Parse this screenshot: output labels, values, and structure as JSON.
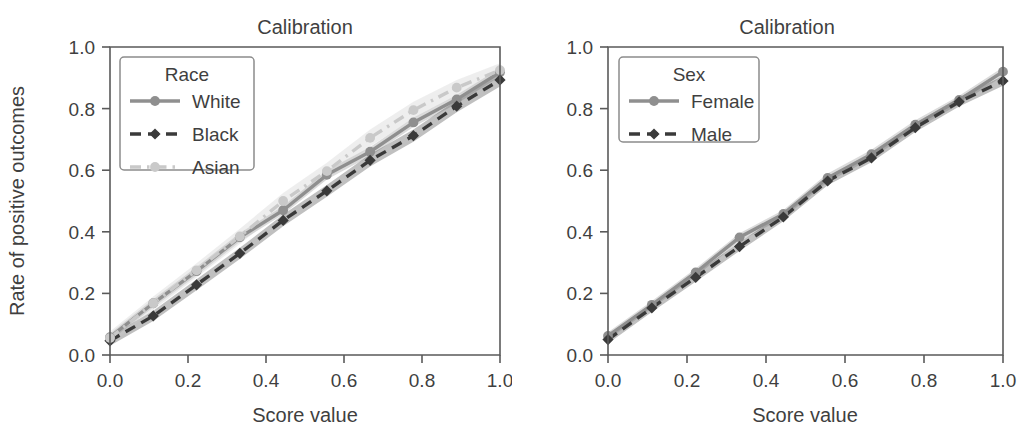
{
  "figure": {
    "width": 1025,
    "height": 434,
    "background": "#ffffff",
    "panels": [
      "race",
      "sex"
    ]
  },
  "colors": {
    "white_series": "#8f8f8f",
    "black_series": "#3a3a3a",
    "asian_series": "#c9c9c9",
    "female_series": "#8f8f8f",
    "male_series": "#3a3a3a",
    "axis": "#5a5a5a",
    "text": "#3f3f3f",
    "band": "#d9d9d9"
  },
  "chart_data": [
    {
      "type": "line",
      "id": "race",
      "title": "Calibration",
      "xlabel": "Score value",
      "ylabel": "Rate of positive outcomes",
      "xlim": [
        0.0,
        1.0
      ],
      "ylim": [
        0.0,
        1.0
      ],
      "xticks": [
        "0.0",
        "0.2",
        "0.4",
        "0.6",
        "0.8",
        "1.0"
      ],
      "xtick_values": [
        0.0,
        0.2,
        0.4,
        0.6,
        0.8,
        1.0
      ],
      "yticks": [
        "0.0",
        "0.2",
        "0.4",
        "0.6",
        "0.8",
        "1.0"
      ],
      "ytick_values": [
        0.0,
        0.2,
        0.4,
        0.6,
        0.8,
        1.0
      ],
      "grid": false,
      "legend_title": "Race",
      "legend_position": "upper left",
      "x": [
        0.0,
        0.111,
        0.222,
        0.333,
        0.444,
        0.556,
        0.667,
        0.778,
        0.889,
        1.0
      ],
      "series": [
        {
          "name": "White",
          "color": "#8f8f8f",
          "linestyle": "solid",
          "marker": "circle",
          "values": [
            0.058,
            0.168,
            0.272,
            0.382,
            0.47,
            0.585,
            0.66,
            0.755,
            0.83,
            0.918
          ],
          "band_low": [
            0.046,
            0.155,
            0.258,
            0.368,
            0.456,
            0.57,
            0.645,
            0.74,
            0.816,
            0.904
          ],
          "band_high": [
            0.07,
            0.181,
            0.286,
            0.396,
            0.484,
            0.6,
            0.675,
            0.77,
            0.844,
            0.932
          ]
        },
        {
          "name": "Black",
          "color": "#3a3a3a",
          "linestyle": "dashed",
          "marker": "diamond",
          "values": [
            0.046,
            0.127,
            0.228,
            0.33,
            0.437,
            0.533,
            0.632,
            0.712,
            0.808,
            0.893
          ],
          "band_low": [
            0.03,
            0.11,
            0.21,
            0.312,
            0.418,
            0.514,
            0.612,
            0.692,
            0.788,
            0.872
          ],
          "band_high": [
            0.062,
            0.144,
            0.246,
            0.348,
            0.456,
            0.552,
            0.652,
            0.732,
            0.828,
            0.914
          ]
        },
        {
          "name": "Asian",
          "color": "#c9c9c9",
          "linestyle": "dashdot",
          "marker": "circle",
          "values": [
            0.055,
            0.168,
            0.275,
            0.385,
            0.5,
            0.597,
            0.705,
            0.795,
            0.868,
            0.925
          ],
          "band_low": [
            0.034,
            0.146,
            0.252,
            0.36,
            0.474,
            0.57,
            0.678,
            0.768,
            0.843,
            0.903
          ],
          "band_high": [
            0.076,
            0.19,
            0.298,
            0.41,
            0.526,
            0.624,
            0.732,
            0.822,
            0.893,
            0.947
          ]
        }
      ]
    },
    {
      "type": "line",
      "id": "sex",
      "title": "Calibration",
      "xlabel": "Score value",
      "ylabel": "",
      "xlim": [
        0.0,
        1.0
      ],
      "ylim": [
        0.0,
        1.0
      ],
      "xticks": [
        "0.0",
        "0.2",
        "0.4",
        "0.6",
        "0.8",
        "1.0"
      ],
      "xtick_values": [
        0.0,
        0.2,
        0.4,
        0.6,
        0.8,
        1.0
      ],
      "yticks": [
        "0.0",
        "0.2",
        "0.4",
        "0.6",
        "0.8",
        "1.0"
      ],
      "ytick_values": [
        0.0,
        0.2,
        0.4,
        0.6,
        0.8,
        1.0
      ],
      "grid": false,
      "legend_title": "Sex",
      "legend_position": "upper left",
      "x": [
        0.0,
        0.111,
        0.222,
        0.333,
        0.444,
        0.556,
        0.667,
        0.778,
        0.889,
        1.0
      ],
      "series": [
        {
          "name": "Female",
          "color": "#8f8f8f",
          "linestyle": "solid",
          "marker": "circle",
          "values": [
            0.062,
            0.163,
            0.268,
            0.382,
            0.458,
            0.575,
            0.652,
            0.748,
            0.828,
            0.92
          ],
          "band_low": [
            0.05,
            0.151,
            0.255,
            0.369,
            0.445,
            0.561,
            0.638,
            0.734,
            0.814,
            0.906
          ],
          "band_high": [
            0.074,
            0.175,
            0.281,
            0.395,
            0.471,
            0.589,
            0.666,
            0.762,
            0.842,
            0.934
          ]
        },
        {
          "name": "Male",
          "color": "#3a3a3a",
          "linestyle": "dashed",
          "marker": "diamond",
          "values": [
            0.05,
            0.153,
            0.252,
            0.352,
            0.448,
            0.565,
            0.64,
            0.738,
            0.822,
            0.89
          ],
          "band_low": [
            0.037,
            0.14,
            0.238,
            0.338,
            0.434,
            0.551,
            0.626,
            0.724,
            0.807,
            0.874
          ],
          "band_high": [
            0.063,
            0.166,
            0.266,
            0.366,
            0.462,
            0.579,
            0.654,
            0.752,
            0.837,
            0.906
          ]
        }
      ]
    }
  ]
}
